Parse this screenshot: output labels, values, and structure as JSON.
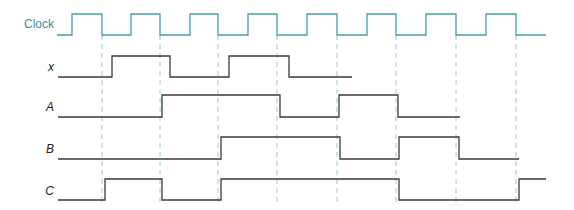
{
  "colors": {
    "clock": "#4a9ba6",
    "dashed": "#9cc9d0",
    "signal": "#3a3a3a",
    "clock_label": "#3a8f9c"
  },
  "labels": {
    "clock": "Clock",
    "x": "x",
    "A": "A",
    "B": "B",
    "C": "C"
  },
  "clock_edges_falling": [
    102,
    160,
    218,
    277,
    337,
    396,
    456,
    516
  ],
  "waveforms": {
    "Clock": {
      "high_y": 14,
      "low_y": 35,
      "points": [
        [
          57,
          0
        ],
        [
          72,
          1
        ],
        [
          102,
          0
        ],
        [
          131,
          1
        ],
        [
          160,
          0
        ],
        [
          190,
          1
        ],
        [
          218,
          0
        ],
        [
          248,
          1
        ],
        [
          277,
          0
        ],
        [
          307,
          1
        ],
        [
          337,
          0
        ],
        [
          367,
          1
        ],
        [
          396,
          0
        ],
        [
          426,
          1
        ],
        [
          456,
          0
        ],
        [
          486,
          1
        ],
        [
          516,
          0
        ],
        [
          546,
          0
        ]
      ]
    },
    "x": {
      "high_y": 56,
      "low_y": 77,
      "points": [
        [
          58,
          0
        ],
        [
          112,
          1
        ],
        [
          170,
          0
        ],
        [
          229,
          1
        ],
        [
          289,
          0
        ],
        [
          352,
          0
        ]
      ]
    },
    "A": {
      "high_y": 95,
      "low_y": 117,
      "points": [
        [
          58,
          0
        ],
        [
          162,
          1
        ],
        [
          280,
          0
        ],
        [
          339,
          1
        ],
        [
          398,
          0
        ],
        [
          460,
          0
        ]
      ]
    },
    "B": {
      "high_y": 137,
      "low_y": 159,
      "points": [
        [
          58,
          0
        ],
        [
          221,
          1
        ],
        [
          340,
          0
        ],
        [
          399,
          1
        ],
        [
          459,
          0
        ],
        [
          519,
          0
        ]
      ]
    },
    "C": {
      "high_y": 179,
      "low_y": 200,
      "points": [
        [
          58,
          0
        ],
        [
          105,
          1
        ],
        [
          162,
          0
        ],
        [
          221,
          1
        ],
        [
          399,
          0
        ],
        [
          519,
          1
        ],
        [
          546,
          1
        ]
      ]
    }
  }
}
